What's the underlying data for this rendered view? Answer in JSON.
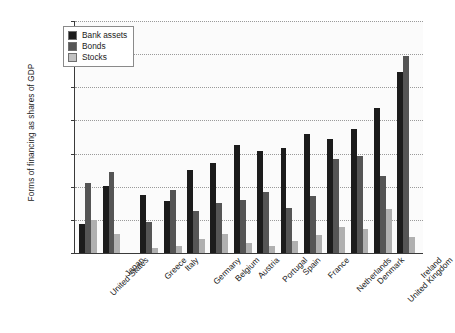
{
  "chart_data": {
    "type": "bar",
    "title": "",
    "xlabel": "",
    "ylabel": "Forms of financing as shares of GDP",
    "ylim": [
      0,
      700
    ],
    "ytick_labels": [
      "0%",
      "100%",
      "200%",
      "300%",
      "400%",
      "500%",
      "600%",
      "700%"
    ],
    "ytick_values": [
      0,
      100,
      200,
      300,
      400,
      500,
      600,
      700
    ],
    "grid": true,
    "legend_position": "top-left",
    "categories": [
      "United States",
      "Japan",
      "Greece",
      "Italy",
      "Germany",
      "Belgium",
      "Austria",
      "Portugal",
      "Spain",
      "France",
      "Netherlands",
      "Denmark",
      "United Kingdom",
      "Ireland"
    ],
    "group_break_after": "Japan",
    "series": [
      {
        "name": "Bank assets",
        "color": "#1c1c1c",
        "values": [
          87,
          203,
          176,
          157,
          251,
          271,
          325,
          308,
          318,
          360,
          344,
          375,
          437,
          545
        ]
      },
      {
        "name": "Bonds",
        "color": "#555555",
        "values": [
          212,
          243,
          93,
          191,
          126,
          150,
          160,
          183,
          136,
          172,
          285,
          293,
          233,
          595
        ]
      },
      {
        "name": "Stocks",
        "color": "#b0b0b0",
        "values": [
          100,
          57,
          15,
          22,
          43,
          57,
          30,
          22,
          35,
          54,
          80,
          73,
          134,
          48
        ]
      }
    ]
  },
  "legend": {
    "items": [
      {
        "label": "Bank assets",
        "swatch": "bank"
      },
      {
        "label": "Bonds",
        "swatch": "bonds"
      },
      {
        "label": "Stocks",
        "swatch": "stocks"
      }
    ]
  }
}
